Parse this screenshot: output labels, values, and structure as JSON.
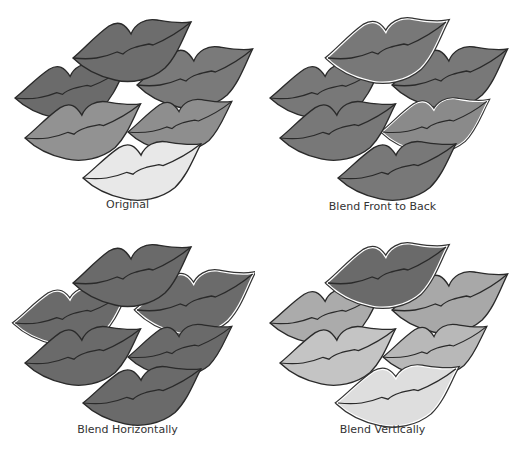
{
  "panels": [
    {
      "caption": "Original",
      "fills": [
        "#6b6b6b",
        "#7a7a7a",
        "#6d6d6d",
        "#8e8e8e",
        "#929292",
        "#e8e8e8"
      ],
      "white_outline": [
        false,
        false,
        false,
        false,
        false,
        false
      ]
    },
    {
      "caption": "Blend Front to Back",
      "fills": [
        "#787878",
        "#787878",
        "#787878",
        "#8a8a8a",
        "#787878",
        "#787878"
      ],
      "white_outline": [
        false,
        false,
        true,
        true,
        false,
        false
      ]
    },
    {
      "caption": "Blend Horizontally",
      "fills": [
        "#6a6a6a",
        "#6b6b6b",
        "#6a6a6a",
        "#6a6a6a",
        "#6a6a6a",
        "#6a6a6a"
      ],
      "white_outline": [
        true,
        true,
        false,
        false,
        false,
        false
      ]
    },
    {
      "caption": "Blend Vertically",
      "fills": [
        "#ababab",
        "#a8a8a8",
        "#6a6a6a",
        "#b8b8b8",
        "#c4c4c4",
        "#dedede"
      ],
      "white_outline": [
        false,
        false,
        true,
        false,
        false,
        true
      ]
    }
  ]
}
